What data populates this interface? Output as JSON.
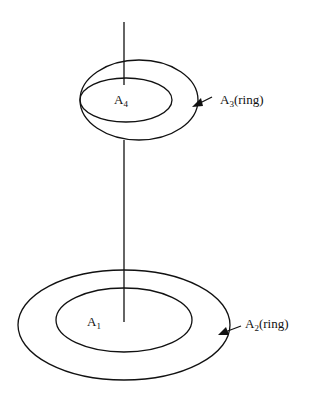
{
  "diagram": {
    "labels": {
      "a4": {
        "base": "A",
        "sub": "4"
      },
      "a3": {
        "base": "A",
        "sub": "3",
        "suffix": "(ring)"
      },
      "a1": {
        "base": "A",
        "sub": "1"
      },
      "a2": {
        "base": "A",
        "sub": "2",
        "suffix": "(ring)"
      }
    }
  }
}
